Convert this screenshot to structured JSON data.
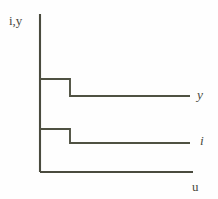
{
  "figure": {
    "background_color": "#fefefe",
    "line_color": "#4a4b3e",
    "width": 218,
    "height": 199,
    "axis_label_y": "i,y",
    "axis_label_x": "u",
    "curve_label_upper": "y",
    "curve_label_lower": "i"
  },
  "chart_data": {
    "type": "line",
    "title": "",
    "subtitle": "",
    "xlabel": "u",
    "ylabel": "i,y",
    "grid": false,
    "legend_position": "right-inline",
    "axes": {
      "x_origin_px": 40,
      "x_end_px": 193,
      "y_origin_px": 172,
      "y_top_px": 14,
      "xlim": [
        0,
        1
      ],
      "ylim": [
        0,
        1
      ],
      "ticks_x": [],
      "ticks_y": [],
      "arrowheads": false
    },
    "annotations": [
      {
        "text": "i,y",
        "role": "y-axis-label",
        "x_px": 9,
        "y_px": 14
      },
      {
        "text": "u",
        "role": "x-axis-label",
        "x_px": 192,
        "y_px": 180
      },
      {
        "text": "y",
        "role": "series-label",
        "x_px": 197,
        "y_px": 88
      },
      {
        "text": "i",
        "role": "series-label",
        "x_px": 200,
        "y_px": 134
      }
    ],
    "series": [
      {
        "name": "y",
        "shape": "step-down",
        "label": "y",
        "color": "#4f5142",
        "points_px": [
          {
            "x": 40,
            "y": 79
          },
          {
            "x": 70,
            "y": 79
          },
          {
            "x": 70,
            "y": 96
          },
          {
            "x": 190,
            "y": 96
          }
        ],
        "level_high": 0.59,
        "level_low": 0.48,
        "step_x": 0.2
      },
      {
        "name": "i",
        "shape": "step-down",
        "label": "i",
        "color": "#4f5142",
        "points_px": [
          {
            "x": 40,
            "y": 129
          },
          {
            "x": 70,
            "y": 129
          },
          {
            "x": 70,
            "y": 143
          },
          {
            "x": 190,
            "y": 143
          }
        ],
        "level_high": 0.27,
        "level_low": 0.18,
        "step_x": 0.2
      }
    ]
  }
}
